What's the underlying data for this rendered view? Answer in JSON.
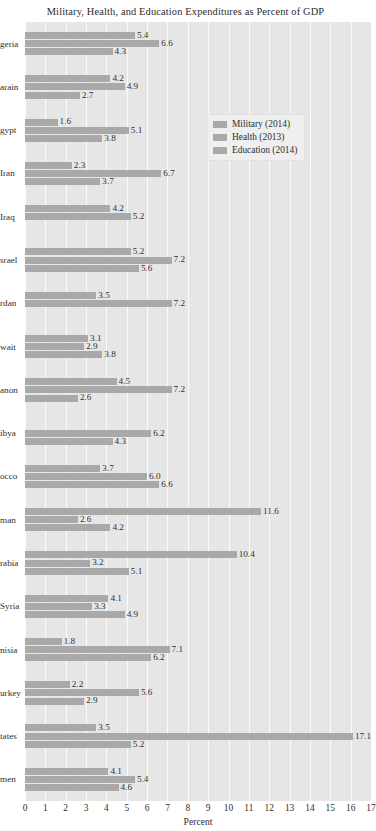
{
  "chart_data": {
    "type": "bar",
    "orientation": "horizontal",
    "title": "Military, Health, and Education Expenditures as Percent of GDP",
    "xlabel": "Percent",
    "ylabel": "",
    "xlim": [
      0,
      17
    ],
    "xticks": [
      0,
      1,
      2,
      3,
      4,
      5,
      6,
      7,
      8,
      9,
      10,
      11,
      12,
      13,
      14,
      15,
      16,
      17
    ],
    "grid": "vertical-white",
    "legend_position": "upper-right-inside",
    "categories": [
      "Algeria",
      "Bahrain",
      "Egypt",
      "Iran",
      "Iraq",
      "Israel",
      "Jordan",
      "Kuwait",
      "Lebanon",
      "Libya",
      "Morocco",
      "Oman",
      "Saudi Arabia",
      "Syria",
      "Tunisia",
      "Turkey",
      "United States",
      "Yemen"
    ],
    "category_labels_clipped": [
      "geria",
      "arain",
      "gypt",
      "Iran",
      "Iraq",
      "srael",
      "rdan",
      "wait",
      "anon",
      "ibya",
      "occo",
      "man",
      "rabia",
      "Syria",
      "nisia",
      "urkey",
      "tates",
      "men"
    ],
    "series": [
      {
        "name": "Military (2014)",
        "color": "#a9a9a9",
        "values": [
          5.4,
          4.2,
          1.6,
          2.3,
          4.2,
          5.2,
          3.5,
          3.1,
          4.5,
          null,
          3.7,
          11.6,
          10.4,
          4.1,
          1.8,
          2.2,
          3.5,
          4.1
        ]
      },
      {
        "name": "Health (2013)",
        "color": "#a9a9a9",
        "values": [
          6.6,
          4.9,
          5.1,
          6.7,
          5.2,
          7.2,
          7.2,
          2.9,
          7.2,
          6.2,
          6.0,
          2.6,
          3.2,
          3.3,
          7.1,
          5.6,
          17.1,
          5.4
        ]
      },
      {
        "name": "Education (2014)",
        "color": "#a9a9a9",
        "values": [
          4.3,
          2.7,
          3.8,
          3.7,
          null,
          5.6,
          null,
          3.8,
          2.6,
          4.3,
          6.6,
          4.2,
          5.1,
          4.9,
          6.2,
          2.9,
          5.2,
          4.6
        ]
      }
    ],
    "value_labels": {
      "Algeria": [
        "5.4",
        "6.6",
        "4.3"
      ],
      "Bahrain": [
        "4.2",
        "4.9",
        "2.7"
      ],
      "Egypt": [
        "1.6",
        "5.1",
        "3.8"
      ],
      "Iran": [
        "2.3",
        "6.7",
        "3.7"
      ],
      "Iraq": [
        "4.2",
        "5.2",
        ""
      ],
      "Israel": [
        "5.2",
        "7.2",
        "5.6"
      ],
      "Jordan": [
        "3.5",
        "7.2",
        ""
      ],
      "Kuwait": [
        "3.1",
        "2.9",
        "3.8"
      ],
      "Lebanon": [
        "4.5",
        "7.2",
        "2.6"
      ],
      "Libya": [
        "",
        "6.2",
        "4.3"
      ],
      "Morocco": [
        "3.7",
        "6.0",
        "6.6"
      ],
      "Oman": [
        "11.6",
        "2.6",
        "4.2"
      ],
      "Saudi Arabia": [
        "10.4",
        "3.2",
        "5.1"
      ],
      "Syria": [
        "4.1",
        "3.3",
        "4.9"
      ],
      "Tunisia": [
        "1.8",
        "7.1",
        "6.2"
      ],
      "Turkey": [
        "2.2",
        "5.6",
        "2.9"
      ],
      "United States": [
        "3.5",
        "17.1",
        "5.2"
      ],
      "Yemen": [
        "4.1",
        "5.4",
        "4.6"
      ]
    },
    "plot_background": "#e6e6e6",
    "gridline_color": "#fbfbfb",
    "bar_color": "#a9a9a9"
  },
  "legend": {
    "items": [
      {
        "label": "Military (2014)"
      },
      {
        "label": "Health (2013)"
      },
      {
        "label": "Education (2014)"
      }
    ]
  }
}
